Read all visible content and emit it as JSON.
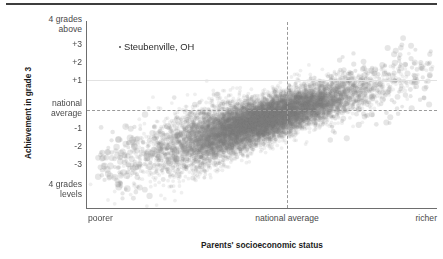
{
  "figure": {
    "top_rule_color": "#3d3d3d",
    "axis_color": "#6e6e6e",
    "point_color": "#808080",
    "grid_color": "#9a9a9a"
  },
  "axes": {
    "y_title": "Achievement in grade 3",
    "x_title": "Parents' socioeconomic status",
    "y_ticks": [
      "4 grades\nabove",
      "+3",
      "+2",
      "+1",
      "national\naverage",
      "-1",
      "-2",
      "-3",
      "4 grades\nlevels"
    ],
    "x_ticks": [
      "poorer",
      "national average",
      "richer"
    ]
  },
  "annotations": [
    {
      "label": "Steubenville, OH",
      "marker": "dot-marker"
    }
  ],
  "chart_data": {
    "type": "scatter",
    "title": "",
    "xlabel": "Parents' socioeconomic status",
    "ylabel": "Achievement in grade 3",
    "xlim": [
      -3.2,
      3.2
    ],
    "ylim": [
      -4.5,
      4.5
    ],
    "grid": true,
    "legend": null,
    "x_tick_labels": [
      "poorer",
      "national average",
      "richer"
    ],
    "x_tick_values": [
      -3.2,
      0,
      3.2
    ],
    "y_tick_labels": [
      "4 grades above",
      "+3",
      "+2",
      "+1",
      "national average",
      "-1",
      "-2",
      "-3",
      "4 grades levels"
    ],
    "y_tick_values": [
      4,
      3,
      2,
      1,
      0,
      -1,
      -2,
      -3,
      -4
    ],
    "reference_lines": [
      {
        "orientation": "vertical",
        "value": 0,
        "style": "dashed",
        "label": "national average"
      },
      {
        "orientation": "horizontal",
        "value": 0,
        "style": "dashed",
        "label": "national average"
      },
      {
        "orientation": "horizontal",
        "value": 1,
        "style": "solid-faint",
        "label": "+1"
      }
    ],
    "annotations": [
      {
        "text": "Steubenville, OH",
        "x": -0.55,
        "y": 2.0
      }
    ],
    "n_points": 12000,
    "correlation": 0.78,
    "point_opacity": 0.12,
    "point_radius_px": 1.9,
    "series": [
      {
        "name": "school districts",
        "slope": 0.82,
        "intercept": -0.25,
        "x_mean": 0.0,
        "x_sd": 0.85,
        "residual_sd": 0.5
      }
    ]
  }
}
